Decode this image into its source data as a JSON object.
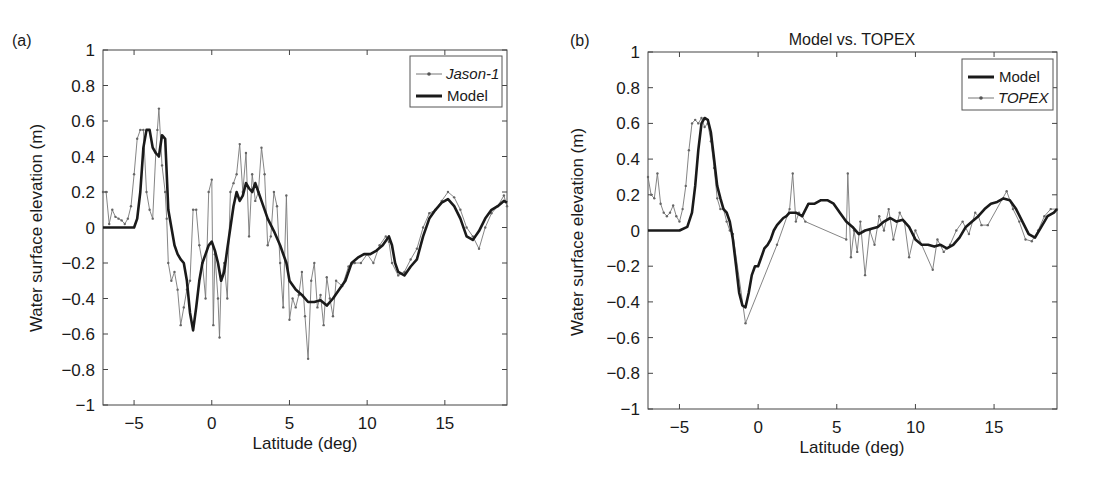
{
  "chart_data": [
    {
      "type": "line",
      "panel_label": "(a)",
      "title": "",
      "xlabel": "Latitude (deg)",
      "ylabel": "Water surface elevation (m)",
      "xlim": [
        -7,
        19
      ],
      "ylim": [
        -1,
        1
      ],
      "xticks": [
        -5,
        0,
        5,
        10,
        15
      ],
      "xtick_labels": [
        "−5",
        "0",
        "5",
        "10",
        "15"
      ],
      "yticks": [
        1,
        0.8,
        0.6,
        0.4,
        0.2,
        0,
        -0.2,
        -0.4,
        -0.6,
        -0.8,
        -1
      ],
      "ytick_labels": [
        "1",
        "0.8",
        "0.6",
        "0.4",
        "0.2",
        "0",
        "−0.2",
        "−0.4",
        "−0.6",
        "−0.8",
        "−1"
      ],
      "grid": false,
      "legend_position": "upper right",
      "legend": [
        "Jason-1",
        "Model"
      ],
      "series": [
        {
          "name": "Jason-1",
          "style": "thin line with dot markers",
          "x": [
            -7.0,
            -6.8,
            -6.6,
            -6.4,
            -6.2,
            -6.0,
            -5.8,
            -5.6,
            -5.4,
            -5.2,
            -5.0,
            -4.8,
            -4.6,
            -4.4,
            -4.2,
            -4.0,
            -3.8,
            -3.6,
            -3.5,
            -3.4,
            -3.2,
            -3.0,
            -2.9,
            -2.8,
            -2.6,
            -2.4,
            -2.2,
            -2.0,
            -1.8,
            -1.6,
            -1.4,
            -1.2,
            -1.0,
            -0.8,
            -0.6,
            -0.4,
            -0.2,
            0.0,
            0.1,
            0.2,
            0.4,
            0.5,
            0.6,
            0.8,
            1.0,
            1.2,
            1.4,
            1.6,
            1.8,
            2.0,
            2.2,
            2.4,
            2.6,
            2.8,
            3.0,
            3.2,
            3.4,
            3.6,
            3.8,
            4.0,
            4.2,
            4.4,
            4.6,
            4.8,
            5.0,
            5.2,
            5.4,
            5.6,
            5.8,
            6.0,
            6.2,
            6.4,
            6.6,
            6.8,
            7.0,
            7.2,
            7.4,
            7.6,
            7.8,
            8.0,
            8.4,
            8.8,
            9.2,
            9.6,
            10.0,
            10.4,
            10.8,
            11.2,
            11.4,
            11.6,
            12.0,
            12.4,
            12.8,
            13.2,
            13.6,
            14.0,
            14.4,
            14.8,
            15.2,
            15.6,
            16.0,
            16.4,
            16.8,
            17.2,
            17.6,
            18.0,
            18.4,
            18.8,
            19.0
          ],
          "y": [
            0.2,
            0.2,
            0.02,
            0.1,
            0.06,
            0.05,
            0.04,
            0.02,
            0.05,
            0.12,
            0.3,
            0.5,
            0.55,
            0.55,
            0.2,
            0.1,
            0.05,
            0.42,
            0.55,
            0.67,
            0.35,
            0.2,
            0.05,
            -0.2,
            -0.3,
            -0.25,
            -0.35,
            -0.55,
            -0.45,
            -0.35,
            -0.3,
            0.1,
            0.1,
            -0.1,
            -0.2,
            -0.4,
            0.2,
            0.27,
            -0.55,
            -0.15,
            -0.4,
            -0.62,
            -0.3,
            -0.2,
            -0.4,
            0.2,
            0.25,
            0.3,
            0.47,
            0.2,
            0.42,
            -0.05,
            0.3,
            0.15,
            0.2,
            0.45,
            0.3,
            -0.1,
            -0.05,
            0.2,
            0.12,
            -0.2,
            -0.45,
            0.18,
            -0.52,
            -0.4,
            -0.45,
            -0.38,
            -0.25,
            -0.5,
            -0.74,
            -0.3,
            -0.2,
            -0.45,
            -0.38,
            -0.55,
            -0.28,
            -0.4,
            -0.5,
            -0.3,
            -0.33,
            -0.22,
            -0.2,
            -0.2,
            -0.15,
            -0.2,
            -0.1,
            -0.05,
            -0.08,
            -0.2,
            -0.27,
            -0.25,
            -0.18,
            -0.12,
            0.0,
            0.08,
            0.1,
            0.15,
            0.2,
            0.17,
            0.1,
            0.0,
            -0.05,
            -0.12,
            0.0,
            0.08,
            0.12,
            0.18,
            0.12
          ]
        },
        {
          "name": "Model",
          "style": "thick solid line",
          "x": [
            -7.0,
            -6.0,
            -5.5,
            -5.0,
            -4.8,
            -4.6,
            -4.4,
            -4.2,
            -4.0,
            -3.8,
            -3.6,
            -3.4,
            -3.2,
            -3.0,
            -2.8,
            -2.6,
            -2.4,
            -2.2,
            -2.0,
            -1.8,
            -1.6,
            -1.4,
            -1.2,
            -1.0,
            -0.8,
            -0.6,
            -0.4,
            -0.2,
            0.0,
            0.2,
            0.4,
            0.6,
            0.8,
            1.0,
            1.2,
            1.4,
            1.6,
            1.8,
            2.0,
            2.2,
            2.4,
            2.6,
            2.8,
            3.0,
            3.2,
            3.6,
            4.0,
            4.4,
            4.8,
            5.0,
            5.4,
            5.8,
            6.2,
            6.6,
            7.0,
            7.4,
            7.8,
            8.2,
            8.6,
            9.0,
            9.4,
            9.8,
            10.2,
            10.6,
            11.0,
            11.4,
            11.6,
            11.8,
            12.0,
            12.4,
            12.8,
            13.2,
            13.6,
            14.0,
            14.4,
            14.8,
            15.2,
            15.6,
            16.0,
            16.4,
            16.8,
            17.2,
            17.6,
            18.0,
            18.4,
            18.8,
            19.0
          ],
          "y": [
            0.0,
            0.0,
            0.0,
            0.0,
            0.05,
            0.2,
            0.45,
            0.55,
            0.55,
            0.45,
            0.42,
            0.4,
            0.52,
            0.5,
            0.1,
            0.0,
            -0.1,
            -0.15,
            -0.18,
            -0.2,
            -0.3,
            -0.48,
            -0.58,
            -0.45,
            -0.3,
            -0.2,
            -0.15,
            -0.1,
            -0.08,
            -0.13,
            -0.2,
            -0.3,
            -0.25,
            -0.12,
            0.0,
            0.12,
            0.2,
            0.15,
            0.18,
            0.25,
            0.22,
            0.2,
            0.25,
            0.2,
            0.15,
            0.05,
            -0.02,
            -0.1,
            -0.2,
            -0.3,
            -0.35,
            -0.38,
            -0.42,
            -0.42,
            -0.41,
            -0.44,
            -0.4,
            -0.35,
            -0.3,
            -0.2,
            -0.17,
            -0.15,
            -0.15,
            -0.13,
            -0.1,
            -0.05,
            -0.1,
            -0.2,
            -0.25,
            -0.27,
            -0.22,
            -0.18,
            -0.05,
            0.05,
            0.1,
            0.14,
            0.16,
            0.12,
            0.05,
            -0.05,
            -0.07,
            -0.02,
            0.05,
            0.1,
            0.12,
            0.15,
            0.14
          ]
        }
      ]
    },
    {
      "type": "line",
      "panel_label": "(b)",
      "title": "Model vs. TOPEX",
      "xlabel": "Latitude (deg)",
      "ylabel": "Water surface elevation (m)",
      "xlim": [
        -7,
        19
      ],
      "ylim": [
        -1,
        1
      ],
      "xticks": [
        -5,
        0,
        5,
        10,
        15
      ],
      "xtick_labels": [
        "−5",
        "0",
        "5",
        "10",
        "15"
      ],
      "yticks": [
        1,
        0.8,
        0.6,
        0.4,
        0.2,
        0,
        -0.2,
        -0.4,
        -0.6,
        -0.8,
        -1
      ],
      "ytick_labels": [
        "1",
        "0.8",
        "0.6",
        "0.4",
        "0.2",
        "0",
        "−0.2",
        "−0.4",
        "−0.6",
        "−0.8",
        "−1"
      ],
      "grid": false,
      "legend_position": "upper right",
      "legend": [
        "Model",
        "TOPEX"
      ],
      "series": [
        {
          "name": "Model",
          "style": "thick solid line",
          "x": [
            -7.0,
            -6.0,
            -5.0,
            -4.5,
            -4.2,
            -4.0,
            -3.8,
            -3.6,
            -3.4,
            -3.2,
            -3.0,
            -2.8,
            -2.6,
            -2.4,
            -2.2,
            -2.0,
            -1.8,
            -1.6,
            -1.4,
            -1.2,
            -1.0,
            -0.8,
            -0.6,
            -0.4,
            -0.2,
            0.0,
            0.2,
            0.4,
            0.6,
            0.8,
            1.0,
            1.2,
            1.4,
            1.6,
            1.8,
            2.0,
            2.4,
            2.8,
            3.2,
            3.6,
            4.0,
            4.4,
            4.8,
            5.2,
            5.6,
            6.0,
            6.4,
            6.8,
            7.2,
            7.6,
            8.0,
            8.4,
            8.8,
            9.2,
            9.6,
            10.0,
            10.4,
            10.8,
            11.2,
            11.6,
            12.0,
            12.4,
            12.8,
            13.2,
            13.6,
            14.0,
            14.4,
            14.8,
            15.2,
            15.6,
            16.0,
            16.4,
            16.8,
            17.2,
            17.6,
            18.0,
            18.4,
            18.8,
            19.0
          ],
          "y": [
            0.0,
            0.0,
            0.0,
            0.02,
            0.1,
            0.25,
            0.45,
            0.6,
            0.63,
            0.62,
            0.55,
            0.4,
            0.25,
            0.18,
            0.12,
            0.1,
            0.05,
            -0.05,
            -0.2,
            -0.35,
            -0.42,
            -0.43,
            -0.35,
            -0.25,
            -0.2,
            -0.2,
            -0.15,
            -0.1,
            -0.08,
            -0.05,
            0.0,
            0.03,
            0.05,
            0.07,
            0.08,
            0.1,
            0.1,
            0.08,
            0.15,
            0.15,
            0.17,
            0.17,
            0.15,
            0.1,
            0.05,
            0.02,
            -0.02,
            0.0,
            0.01,
            0.02,
            0.05,
            0.07,
            0.05,
            0.06,
            0.02,
            -0.05,
            -0.08,
            -0.08,
            -0.09,
            -0.08,
            -0.1,
            -0.08,
            -0.04,
            0.02,
            0.05,
            0.08,
            0.12,
            0.15,
            0.16,
            0.18,
            0.17,
            0.12,
            0.05,
            -0.02,
            -0.04,
            0.02,
            0.08,
            0.1,
            0.12
          ]
        },
        {
          "name": "TOPEX",
          "style": "thin line with dot markers",
          "x": [
            -7.0,
            -6.8,
            -6.6,
            -6.4,
            -6.2,
            -6.0,
            -5.8,
            -5.6,
            -5.4,
            -5.2,
            -5.0,
            -4.8,
            -4.6,
            -4.4,
            -4.2,
            -4.0,
            -3.8,
            -3.6,
            -3.4,
            -3.2,
            -3.0,
            -2.8,
            -2.6,
            -2.4,
            -2.2,
            -2.0,
            -1.8,
            -1.6,
            -0.8,
            1.2,
            2.0,
            2.2,
            2.4,
            2.6,
            2.8,
            3.0,
            5.6,
            5.7,
            5.9,
            6.1,
            6.3,
            6.5,
            6.8,
            7.1,
            7.4,
            7.7,
            8.0,
            8.3,
            8.6,
            9.0,
            9.3,
            9.6,
            10.0,
            11.1,
            11.4,
            11.8,
            12.2,
            12.6,
            13.0,
            13.4,
            13.8,
            14.0,
            14.2,
            14.6,
            15.8,
            16.2,
            16.6,
            17.0,
            17.4,
            17.8,
            18.2,
            18.6,
            19.0
          ],
          "y": [
            0.3,
            0.2,
            0.18,
            0.32,
            0.15,
            0.1,
            0.08,
            0.1,
            0.14,
            0.08,
            0.05,
            0.12,
            0.25,
            0.45,
            0.6,
            0.62,
            0.6,
            0.63,
            0.58,
            0.6,
            0.5,
            0.35,
            0.18,
            0.12,
            0.12,
            0.05,
            0.0,
            -0.02,
            -0.52,
            -0.08,
            0.12,
            0.32,
            0.05,
            0.1,
            0.08,
            0.05,
            -0.05,
            0.32,
            -0.15,
            0.0,
            -0.12,
            0.05,
            -0.25,
            0.0,
            -0.08,
            0.08,
            0.0,
            0.12,
            -0.05,
            0.1,
            0.05,
            -0.15,
            0.0,
            -0.22,
            -0.05,
            -0.12,
            -0.08,
            0.0,
            0.05,
            -0.02,
            0.1,
            0.08,
            0.03,
            0.03,
            0.22,
            0.12,
            0.05,
            -0.05,
            -0.06,
            0.0,
            0.08,
            0.12,
            0.12
          ]
        }
      ]
    }
  ]
}
